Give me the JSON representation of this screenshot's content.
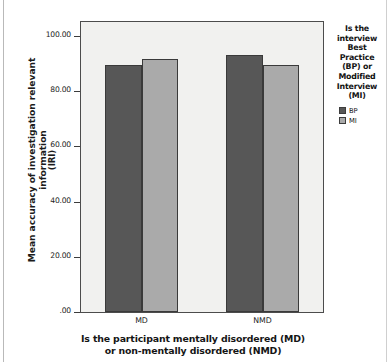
{
  "chart_data": {
    "type": "bar",
    "title": "",
    "categories": [
      "MD",
      "NMD"
    ],
    "series": [
      {
        "name": "BP",
        "values": [
          89.5,
          93.0
        ],
        "color": "#575757"
      },
      {
        "name": "MI",
        "values": [
          91.5,
          89.5
        ],
        "color": "#aaaaaa"
      }
    ],
    "xlabel_line1": "Is the participant mentally disordered (MD)",
    "xlabel_line2": "or non-mentally disordered (NMD)",
    "ylabel_line1": "Mean accuracy of investigation relevant information",
    "ylabel_line2": "(IRI)",
    "ylim": [
      0,
      105
    ],
    "yticks": [
      {
        "value": 0,
        "label": ".00"
      },
      {
        "value": 20,
        "label": "20.00"
      },
      {
        "value": 40,
        "label": "40.00"
      },
      {
        "value": 60,
        "label": "60.00"
      },
      {
        "value": 80,
        "label": "80.00"
      },
      {
        "value": 100,
        "label": "100.00"
      }
    ],
    "grid": false,
    "legend_position": "right",
    "legend_title": "Is the interview Best Practice (BP) or Modified Interview (MI)",
    "legend_title_lines": [
      "Is the",
      "interview",
      "Best",
      "Practice",
      "(BP) or",
      "Modified",
      "Interview",
      "(MI)"
    ],
    "legend_entries": [
      {
        "label": "BP",
        "color": "#575757"
      },
      {
        "label": "MI",
        "color": "#aaaaaa"
      }
    ],
    "plot_background": "#f1f1ef",
    "axis_color": "#4c4c4c"
  }
}
